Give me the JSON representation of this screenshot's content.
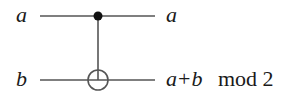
{
  "diagram": {
    "type": "quantum-circuit",
    "gate": "CNOT",
    "inputs": {
      "top": "a",
      "bottom": "b"
    },
    "outputs": {
      "top": "a",
      "bottom": {
        "expr_a": "a",
        "op": "+",
        "expr_b": "b",
        "mod_text": "mod 2"
      }
    },
    "colors": {
      "line": "#555555",
      "text": "#1a1a1a",
      "control_dot": "#111111"
    }
  }
}
